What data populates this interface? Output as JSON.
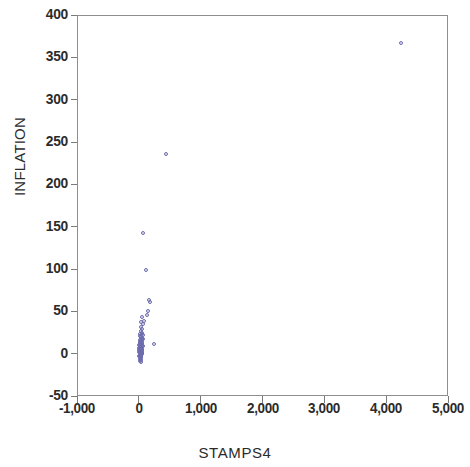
{
  "chart_data": {
    "type": "scatter",
    "title": "",
    "xlabel": "STAMPS4",
    "ylabel": "INFLATION",
    "xlim": [
      -1000,
      5000
    ],
    "ylim": [
      -50,
      400
    ],
    "xticks": [
      -1000,
      0,
      1000,
      2000,
      3000,
      4000,
      5000
    ],
    "xticklabels": [
      "-1,000",
      "0",
      "1,000",
      "2,000",
      "3,000",
      "4,000",
      "5,000"
    ],
    "yticks": [
      -50,
      0,
      50,
      100,
      150,
      200,
      250,
      300,
      350,
      400
    ],
    "yticklabels": [
      "-50",
      "0",
      "50",
      "100",
      "150",
      "200",
      "250",
      "300",
      "350",
      "400"
    ],
    "grid": false,
    "legend": null,
    "marker": {
      "shape": "open-circle",
      "color": "#6d6daf",
      "edge_color": "#6d6daf",
      "size": 4
    },
    "series": [
      {
        "name": "observations",
        "points": [
          [
            4220,
            368
          ],
          [
            430,
            237
          ],
          [
            50,
            144
          ],
          [
            95,
            100
          ],
          [
            150,
            65
          ],
          [
            160,
            62
          ],
          [
            130,
            52
          ],
          [
            120,
            47
          ],
          [
            60,
            40
          ],
          [
            45,
            36
          ],
          [
            225,
            13
          ],
          [
            30,
            45
          ],
          [
            25,
            38
          ],
          [
            20,
            33
          ],
          [
            35,
            30
          ],
          [
            15,
            28
          ],
          [
            40,
            26
          ],
          [
            10,
            25
          ],
          [
            30,
            24
          ],
          [
            50,
            23
          ],
          [
            5,
            22
          ],
          [
            22,
            21
          ],
          [
            38,
            20
          ],
          [
            12,
            19
          ],
          [
            28,
            18
          ],
          [
            45,
            18
          ],
          [
            0,
            17
          ],
          [
            18,
            16
          ],
          [
            33,
            16
          ],
          [
            8,
            15
          ],
          [
            25,
            15
          ],
          [
            42,
            14
          ],
          [
            -5,
            14
          ],
          [
            15,
            13
          ],
          [
            30,
            13
          ],
          [
            5,
            12
          ],
          [
            20,
            12
          ],
          [
            38,
            11
          ],
          [
            -10,
            11
          ],
          [
            10,
            10
          ],
          [
            26,
            10
          ],
          [
            45,
            10
          ],
          [
            0,
            9
          ],
          [
            16,
            9
          ],
          [
            32,
            9
          ],
          [
            -8,
            8
          ],
          [
            8,
            8
          ],
          [
            24,
            8
          ],
          [
            40,
            7
          ],
          [
            -3,
            7
          ],
          [
            14,
            7
          ],
          [
            28,
            6
          ],
          [
            4,
            6
          ],
          [
            20,
            6
          ],
          [
            36,
            5
          ],
          [
            -12,
            5
          ],
          [
            10,
            5
          ],
          [
            26,
            4
          ],
          [
            2,
            4
          ],
          [
            18,
            4
          ],
          [
            34,
            3
          ],
          [
            -6,
            3
          ],
          [
            12,
            3
          ],
          [
            28,
            2
          ],
          [
            6,
            2
          ],
          [
            22,
            2
          ],
          [
            -2,
            1
          ],
          [
            14,
            1
          ],
          [
            30,
            1
          ],
          [
            8,
            0
          ],
          [
            24,
            0
          ],
          [
            0,
            0
          ],
          [
            16,
            -1
          ],
          [
            -9,
            -2
          ],
          [
            10,
            -2
          ],
          [
            26,
            -3
          ],
          [
            4,
            -3
          ],
          [
            20,
            -4
          ],
          [
            -4,
            -5
          ],
          [
            12,
            -6
          ],
          [
            6,
            -8
          ],
          [
            18,
            -9
          ]
        ]
      }
    ]
  }
}
